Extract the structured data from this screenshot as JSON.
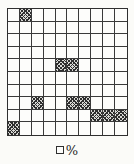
{
  "figure": {
    "type": "hundred-grid-percent-diagram",
    "grid": {
      "rows": 10,
      "cols": 10,
      "total_cells": 100,
      "shaded_count": 10,
      "shaded_percent": 10,
      "shaded_cells": [
        [
          1,
          2
        ],
        [
          5,
          5
        ],
        [
          5,
          6
        ],
        [
          8,
          3
        ],
        [
          8,
          6
        ],
        [
          8,
          7
        ],
        [
          9,
          8
        ],
        [
          9,
          9
        ],
        [
          9,
          10
        ],
        [
          10,
          1
        ]
      ]
    },
    "label": {
      "answer_blank": "□",
      "percent_sign": "%"
    },
    "colors": {
      "grid_line": "#3a3a3a",
      "grid_outer_border": "#2f2f2f",
      "hatch": "#2e2e2e",
      "cell_background": "#fdfdfb",
      "page_background": "#fbfbf8",
      "text": "#1e1e1e"
    }
  }
}
